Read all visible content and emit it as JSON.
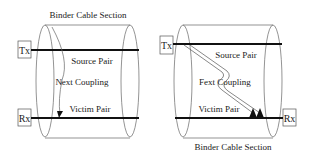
{
  "colors": {
    "background": "#ffffff",
    "line": "#111111",
    "thin_line": "#555555",
    "text": "#222222"
  },
  "left_diagram": {
    "title": "Binder Cable Section",
    "tx_label": "Tx",
    "rx_label": "Rx",
    "source_pair": "Source Pair",
    "coupling": "Next Coupling",
    "victim_pair": "Victim Pair"
  },
  "right_diagram": {
    "title": "Binder Cable Section",
    "tx_label": "Tx",
    "rx_label": "Rx",
    "source_pair": "Source Pair",
    "coupling": "Fext Coupling",
    "victim_pair": "Victim Pair"
  }
}
